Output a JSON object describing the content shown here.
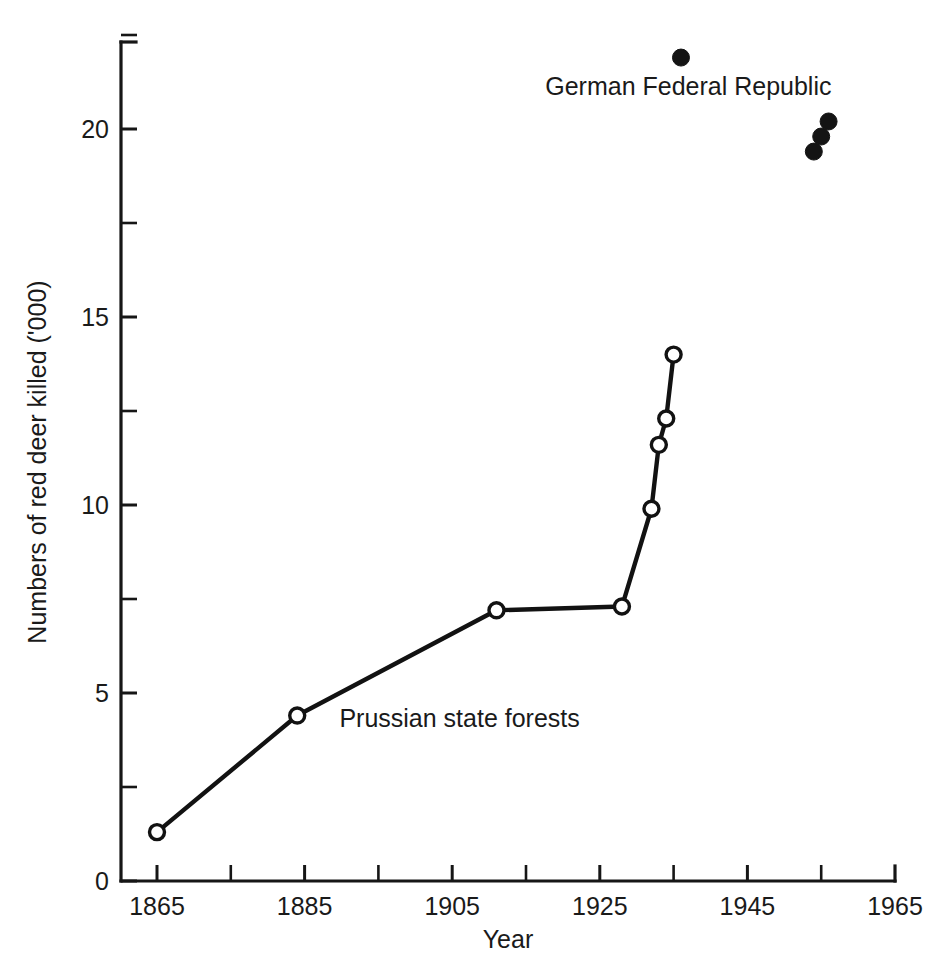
{
  "chart_data": {
    "type": "line",
    "title": "",
    "subtitle": "",
    "xlabel": "Year",
    "ylabel": "Numbers of red deer killed ('000)",
    "xlim": [
      1865,
      1965
    ],
    "ylim": [
      0,
      22.5
    ],
    "grid": false,
    "legend_position": "inline-annotations",
    "x_ticks_major": [
      1865,
      1885,
      1905,
      1925,
      1945,
      1965
    ],
    "x_tick_labels": [
      "1865",
      "1885",
      "1905",
      "1925",
      "1945",
      "1965"
    ],
    "x_ticks_minor": [
      1875,
      1895,
      1915,
      1935,
      1955
    ],
    "y_ticks_major": [
      0,
      5,
      10,
      15,
      20
    ],
    "y_tick_labels": [
      "0",
      "5",
      "10",
      "15",
      "20"
    ],
    "y_ticks_minor": [
      2.5,
      7.5,
      12.5,
      17.5,
      22.5
    ],
    "series": [
      {
        "name": "Prussian state forests",
        "marker": "open-circle",
        "connected": true,
        "x": [
          1865,
          1884,
          1911,
          1928,
          1932,
          1933,
          1934,
          1935
        ],
        "values": [
          1.3,
          4.4,
          7.2,
          7.3,
          9.9,
          11.6,
          12.3,
          14.0
        ]
      },
      {
        "name": "German Federal Republic",
        "marker": "filled-circle",
        "connected": false,
        "x": [
          1936,
          1954,
          1955,
          1956
        ],
        "values": [
          21.9,
          19.4,
          19.8,
          20.2
        ]
      }
    ],
    "annotations": [
      {
        "text": "German Federal Republic",
        "x": 1937,
        "y": 20.9
      },
      {
        "text": "Prussian state forests",
        "x": 1906,
        "y": 4.1
      }
    ]
  },
  "colors": {
    "ink": "#161616",
    "background": "#ffffff",
    "marker_fill_open": "#ffffff",
    "marker_fill_solid": "#141414"
  }
}
